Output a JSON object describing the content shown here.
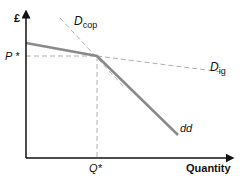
{
  "diagram": {
    "y_axis_label": "£",
    "x_axis_label": "Quantity",
    "price_label": "P *",
    "quantity_label": "Q*",
    "curves": {
      "dcop": {
        "label_main": "D",
        "label_sub": "cop",
        "style": "dashed"
      },
      "dig": {
        "label_main": "D",
        "label_sub": "ig",
        "style": "dashed"
      },
      "dd": {
        "label": "dd",
        "style": "solid"
      }
    },
    "colors": {
      "solid_curve": "#8a8a8a",
      "dashed_curve": "#b0b0b0",
      "axis": "#111111"
    }
  }
}
